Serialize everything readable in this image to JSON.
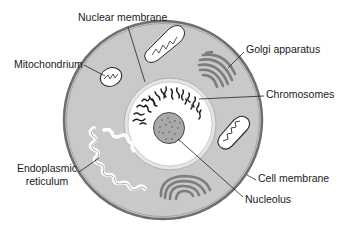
{
  "diagram": {
    "colors": {
      "background": "#ffffff",
      "cytoplasm": "#c9c9c9",
      "cell_membrane": "#6e6e6e",
      "nucleus_fill": "#ffffff",
      "nuclear_ring": "#d8d8d8",
      "nucleolus": "#a8a8a8",
      "organelle_outline": "#2a2a2a",
      "golgi": "#7d7d7d",
      "leader_line": "#222222"
    },
    "labels": {
      "nuclear_membrane": "Nuclear membrane",
      "mitochondrium": "Mitochondrium",
      "golgi_apparatus": "Golgi apparatus",
      "chromosomes": "Chromosomes",
      "endoplasmic_line1": "Endoplasmic",
      "endoplasmic_line2": "reticulum",
      "cell_membrane": "Cell membrane",
      "nucleolus": "Nucleolus"
    }
  }
}
